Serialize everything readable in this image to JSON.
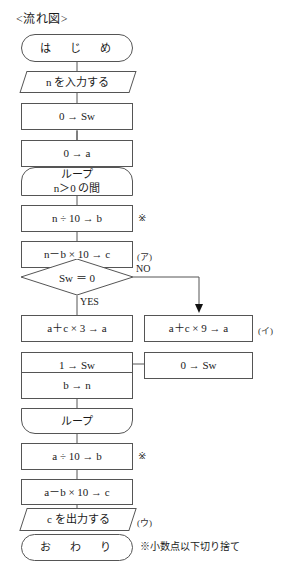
{
  "document": {
    "title": "<流れ図>",
    "footnote": "※小数点以下切り捨て"
  },
  "flowchart": {
    "type": "diagram",
    "nodes": [
      {
        "id": "start",
        "shape": "terminator",
        "text": "は　じ　め"
      },
      {
        "id": "input_n",
        "shape": "io",
        "text": "n を入力する"
      },
      {
        "id": "sw0",
        "shape": "process",
        "text": "0 → Sw"
      },
      {
        "id": "a0",
        "shape": "process",
        "text": "0 → a"
      },
      {
        "id": "loop_start",
        "shape": "loop-start",
        "text": "ループ",
        "text2": "n＞0 の間"
      },
      {
        "id": "n_div_10",
        "shape": "process",
        "text": "n ÷ 10 → b"
      },
      {
        "id": "n_mod_10",
        "shape": "process",
        "text": "n－b × 10 → c"
      },
      {
        "id": "decision",
        "shape": "decision",
        "text": "Sw ＝ 0"
      },
      {
        "id": "a_c_3",
        "shape": "process",
        "text": "a＋c × 3 → a"
      },
      {
        "id": "a_c_9",
        "shape": "process",
        "text": "a＋c × 9 → a"
      },
      {
        "id": "sw1",
        "shape": "process",
        "text": "1 → Sw"
      },
      {
        "id": "sw0b",
        "shape": "process",
        "text": "0 → Sw"
      },
      {
        "id": "b_to_n",
        "shape": "process",
        "text": "b → n"
      },
      {
        "id": "loop_end",
        "shape": "loop-end",
        "text": "ループ"
      },
      {
        "id": "a_div_10",
        "shape": "process",
        "text": "a ÷ 10 → b"
      },
      {
        "id": "a_mod_10",
        "shape": "process",
        "text": "a－b × 10 → c"
      },
      {
        "id": "output_c",
        "shape": "io",
        "text": "c を出力する"
      },
      {
        "id": "end",
        "shape": "terminator",
        "text": "お　わ　り"
      }
    ],
    "edge_labels": {
      "yes": "YES",
      "no": "NO"
    },
    "annotations": [
      {
        "id": "mark_1",
        "text": "※"
      },
      {
        "id": "label_a",
        "text": "(ア)"
      },
      {
        "id": "label_i",
        "text": "(イ)"
      },
      {
        "id": "mark_2",
        "text": "※"
      },
      {
        "id": "label_u",
        "text": "(ウ)"
      }
    ]
  },
  "colors": {
    "stroke": "#555555",
    "text": "#1a1a1a",
    "background": "#ffffff"
  }
}
